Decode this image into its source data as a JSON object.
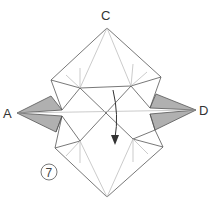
{
  "diagram": {
    "type": "origami-step",
    "labels": {
      "top": "C",
      "left": "A",
      "right": "D"
    },
    "step_number": "7",
    "colors": {
      "line": "#555555",
      "crease": "#b5b5b5",
      "flap_fill": "#b0b0b0",
      "background": "#ffffff"
    },
    "arrow": {
      "direction": "down",
      "meaning": "fold-down"
    }
  }
}
